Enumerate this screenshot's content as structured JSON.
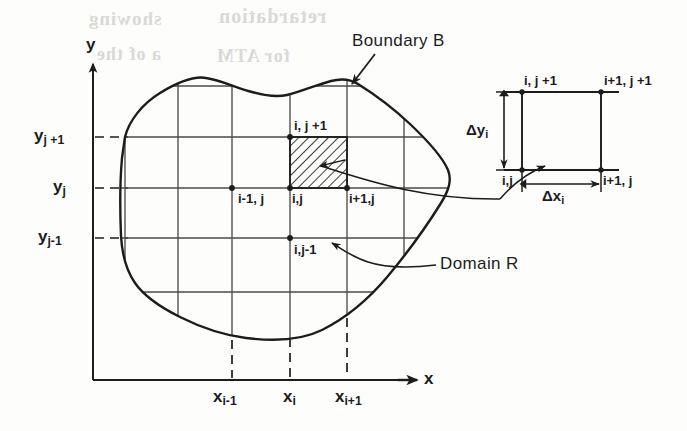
{
  "figure": {
    "background_color": "#fdfdfc",
    "ink_color": "#1c1c1c"
  },
  "axes": {
    "y_label": "y",
    "x_label": "x"
  },
  "y_ticks": [
    {
      "base": "y",
      "sub": "j +1"
    },
    {
      "base": "y",
      "sub": "j"
    },
    {
      "base": "y",
      "sub": "j-1"
    }
  ],
  "x_ticks": [
    {
      "base": "x",
      "sub": "i-1"
    },
    {
      "base": "x",
      "sub": "i"
    },
    {
      "base": "x",
      "sub": "i+1"
    }
  ],
  "grid_nodes": [
    {
      "label": "i, j +1"
    },
    {
      "label": "i-1, j"
    },
    {
      "label": "i,j"
    },
    {
      "label": "i+1,j"
    },
    {
      "label": "i,j-1"
    }
  ],
  "callouts": [
    {
      "text": "Boundary B"
    },
    {
      "text": "Domain R"
    }
  ],
  "inset": {
    "corners": [
      {
        "label": "i, j +1"
      },
      {
        "label": "i+1, j +1"
      },
      {
        "label": "i,j"
      },
      {
        "label": "i+1, j"
      }
    ],
    "dimensions": [
      {
        "base": "Δy",
        "sub": "i"
      },
      {
        "base": "Δx",
        "sub": "i"
      }
    ]
  },
  "ghost_text": [
    {
      "text": "showing"
    },
    {
      "text": "retardation"
    },
    {
      "text": "a of the"
    },
    {
      "text": "for ATM"
    }
  ]
}
